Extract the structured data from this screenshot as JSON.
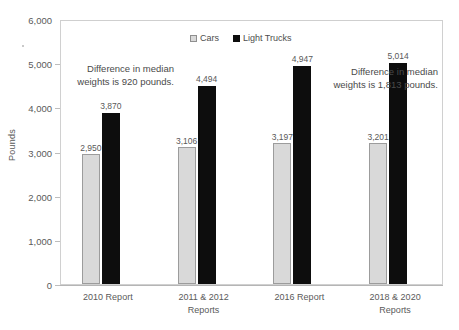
{
  "chart_data": {
    "type": "bar",
    "title": "",
    "xlabel": "",
    "ylabel": "Pounds",
    "ylim": [
      0,
      6000
    ],
    "grid": false,
    "legend_position": "top-center",
    "categories": [
      "2010 Report",
      "2011 & 2012 Reports",
      "2016 Report",
      "2018 & 2020 Reports"
    ],
    "category_lines": [
      [
        "2010 Report"
      ],
      [
        "2011 & 2012",
        "Reports"
      ],
      [
        "2016 Report"
      ],
      [
        "2018 & 2020",
        "Reports"
      ]
    ],
    "series": [
      {
        "name": "Cars",
        "color": "#d9d9d9",
        "values": [
          2950,
          3106,
          3197,
          3201
        ],
        "labels": [
          "2,950",
          "3,106",
          "3,197",
          "3,201"
        ]
      },
      {
        "name": "Light Trucks",
        "color": "#0d0d0d",
        "values": [
          3870,
          4494,
          4947,
          5014
        ],
        "labels": [
          "3,870",
          "4,494",
          "4,947",
          "5,014"
        ]
      }
    ],
    "ytick_labels": [
      "6,000",
      "5,000",
      "4,000",
      "3,000",
      "2,000",
      "1,000",
      "0"
    ],
    "ytick_values": [
      6000,
      5000,
      4000,
      3000,
      2000,
      1000,
      0
    ],
    "annotations": [
      "Difference in median weights is 920 pounds.",
      "Difference in median weights is 1,813 pounds."
    ]
  },
  "legend": {
    "items": [
      {
        "label": "Cars",
        "swatch": "cars-swatch-icon"
      },
      {
        "label": "Light Trucks",
        "swatch": "light-trucks-swatch-icon"
      }
    ]
  },
  "axis": {
    "y_title": "Pounds"
  }
}
